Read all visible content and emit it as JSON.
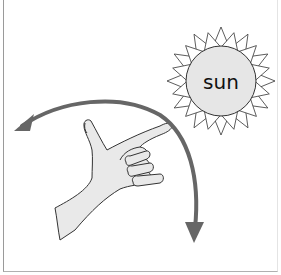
{
  "diagram": {
    "type": "illustration",
    "sun": {
      "label": "sun",
      "fill": "#e6e6e6",
      "ray_fill": "#ffffff",
      "stroke": "#333333"
    },
    "hand": {
      "fill": "#e9e9e9",
      "stroke": "#333333",
      "gesture": "pointing index finger with thumb up"
    },
    "arrow": {
      "color": "#666666",
      "direction": "arc with arrowheads at both ends (left and down)"
    },
    "colors": {
      "background": "#ffffff",
      "frame": "#9a9a9a"
    }
  }
}
